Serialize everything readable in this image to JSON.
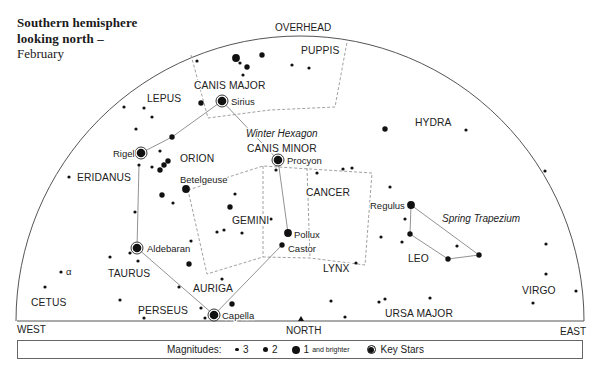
{
  "title": {
    "line1": "Southern hemisphere",
    "line2": "looking north –",
    "line3": "February"
  },
  "legend": {
    "label": "Magnitudes:",
    "mag3": "3",
    "mag2": "2",
    "mag1": "1",
    "mag1_suffix": "and brighter",
    "key": "Key Stars"
  },
  "sky_map": {
    "dome": {
      "cx": 300,
      "cy": 321,
      "rx": 284,
      "ry": 285
    },
    "horizon": {
      "x1": 17,
      "x2": 584,
      "y": 321
    },
    "north_marker": {
      "x": 301,
      "y": 318
    },
    "labels": [
      {
        "text": "OVERHEAD",
        "x": 275,
        "y": 31,
        "kind": "dir"
      },
      {
        "text": "WEST",
        "x": 17,
        "y": 333,
        "kind": "dir"
      },
      {
        "text": "NORTH",
        "x": 286,
        "y": 334,
        "kind": "dir"
      },
      {
        "text": "EAST",
        "x": 560,
        "y": 335,
        "kind": "dir"
      },
      {
        "text": "PUPPIS",
        "x": 301,
        "y": 54,
        "kind": "con"
      },
      {
        "text": "CANIS MAJOR",
        "x": 194,
        "y": 89,
        "kind": "con"
      },
      {
        "text": "Sirius",
        "x": 231,
        "y": 105,
        "kind": "star"
      },
      {
        "text": "LEPUS",
        "x": 147,
        "y": 102,
        "kind": "con"
      },
      {
        "text": "Winter Hexagon",
        "x": 246,
        "y": 137,
        "kind": "ital"
      },
      {
        "text": "CANIS MINOR",
        "x": 247,
        "y": 152,
        "kind": "con"
      },
      {
        "text": "Procyon",
        "x": 287,
        "y": 164,
        "kind": "star"
      },
      {
        "text": "ORION",
        "x": 180,
        "y": 162,
        "kind": "con"
      },
      {
        "text": "Rigel",
        "x": 113,
        "y": 157,
        "kind": "star"
      },
      {
        "text": "ERIDANUS",
        "x": 77,
        "y": 181,
        "kind": "con"
      },
      {
        "text": "Betelgeuse",
        "x": 180,
        "y": 183,
        "kind": "star"
      },
      {
        "text": "HYDRA",
        "x": 415,
        "y": 126,
        "kind": "con"
      },
      {
        "text": "CANCER",
        "x": 306,
        "y": 196,
        "kind": "con"
      },
      {
        "text": "GEMINI",
        "x": 232,
        "y": 224,
        "kind": "con"
      },
      {
        "text": "Pollux",
        "x": 294,
        "y": 238,
        "kind": "star"
      },
      {
        "text": "Castor",
        "x": 288,
        "y": 252,
        "kind": "star"
      },
      {
        "text": "Regulus",
        "x": 370,
        "y": 209,
        "kind": "star"
      },
      {
        "text": "Spring Trapezium",
        "x": 442,
        "y": 222,
        "kind": "ital"
      },
      {
        "text": "LEO",
        "x": 408,
        "y": 262,
        "kind": "con"
      },
      {
        "text": "Aldebaran",
        "x": 147,
        "y": 252,
        "kind": "star"
      },
      {
        "text": "TAURUS",
        "x": 108,
        "y": 277,
        "kind": "con"
      },
      {
        "text": "α",
        "x": 66,
        "y": 275,
        "kind": "star"
      },
      {
        "text": "LYNX",
        "x": 323,
        "y": 272,
        "kind": "con"
      },
      {
        "text": "AURIGA",
        "x": 193,
        "y": 292,
        "kind": "con"
      },
      {
        "text": "CETUS",
        "x": 31,
        "y": 306,
        "kind": "con"
      },
      {
        "text": "PERSEUS",
        "x": 138,
        "y": 314,
        "kind": "con"
      },
      {
        "text": "Capella",
        "x": 222,
        "y": 319,
        "kind": "star"
      },
      {
        "text": "URSA MAJOR",
        "x": 385,
        "y": 317,
        "kind": "con"
      },
      {
        "text": "VIRGO",
        "x": 522,
        "y": 294,
        "kind": "con"
      }
    ],
    "boundaries": [
      {
        "name": "puppis-canis-major-boundary",
        "points": [
          [
            191,
            55
          ],
          [
            208,
            118
          ],
          [
            270,
            110
          ],
          [
            335,
            107
          ],
          [
            347,
            42
          ]
        ],
        "closed": false
      },
      {
        "name": "gemini-cancer-boundary",
        "points": [
          [
            188,
            190
          ],
          [
            263,
            166
          ],
          [
            372,
            173
          ],
          [
            365,
            265
          ],
          [
            310,
            258
          ],
          [
            263,
            257
          ],
          [
            207,
            274
          ]
        ],
        "closed": true
      },
      {
        "name": "gemini-cancer-divider-1",
        "points": [
          [
            263,
            166
          ],
          [
            263,
            257
          ]
        ],
        "closed": false
      },
      {
        "name": "gemini-cancer-divider-2",
        "points": [
          [
            307,
            168
          ],
          [
            310,
            258
          ]
        ],
        "closed": false
      }
    ],
    "asterisms": [
      {
        "name": "winter-hexagon",
        "segments": [
          [
            [
              222,
              101
            ],
            [
              172,
              137
            ],
            [
              141,
              153
            ]
          ],
          [
            [
              222,
              101
            ],
            [
              278,
              160
            ]
          ],
          [
            [
              278,
              160
            ],
            [
              288,
              233
            ]
          ],
          [
            [
              282,
              245
            ],
            [
              214,
              315
            ]
          ],
          [
            [
              214,
              315
            ],
            [
              137,
              248
            ]
          ],
          [
            [
              137,
              248
            ],
            [
              139,
              165
            ]
          ]
        ]
      },
      {
        "name": "spring-trapezium",
        "segments": [
          [
            [
              411,
              205
            ],
            [
              410,
              234
            ],
            [
              448,
              259
            ],
            [
              479,
              255
            ],
            [
              411,
              205
            ]
          ]
        ]
      }
    ],
    "stars": [
      {
        "x": 222,
        "y": 101,
        "mag": "key",
        "name": "Sirius"
      },
      {
        "x": 141,
        "y": 153,
        "mag": "key",
        "name": "Rigel"
      },
      {
        "x": 278,
        "y": 160,
        "mag": "key",
        "name": "Procyon"
      },
      {
        "x": 137,
        "y": 248,
        "mag": "key",
        "name": "Aldebaran"
      },
      {
        "x": 214,
        "y": 315,
        "mag": "key",
        "name": "Capella"
      },
      {
        "x": 186,
        "y": 189,
        "mag": 1,
        "name": "Betelgeuse"
      },
      {
        "x": 288,
        "y": 233,
        "mag": 1,
        "name": "Pollux"
      },
      {
        "x": 411,
        "y": 205,
        "mag": 1,
        "name": "Regulus"
      },
      {
        "x": 236,
        "y": 58,
        "mag": 1
      },
      {
        "x": 282,
        "y": 245,
        "mag": 2,
        "name": "Castor"
      },
      {
        "x": 247,
        "y": 67,
        "mag": 2
      },
      {
        "x": 262,
        "y": 55,
        "mag": 2
      },
      {
        "x": 201,
        "y": 103,
        "mag": 2
      },
      {
        "x": 172,
        "y": 137,
        "mag": 2
      },
      {
        "x": 160,
        "y": 170,
        "mag": 2
      },
      {
        "x": 164,
        "y": 165,
        "mag": 2
      },
      {
        "x": 168,
        "y": 161,
        "mag": 2
      },
      {
        "x": 162,
        "y": 195,
        "mag": 2
      },
      {
        "x": 230,
        "y": 207,
        "mag": 2
      },
      {
        "x": 189,
        "y": 264,
        "mag": 2
      },
      {
        "x": 232,
        "y": 304,
        "mag": 2
      },
      {
        "x": 385,
        "y": 129,
        "mag": 2
      },
      {
        "x": 410,
        "y": 234,
        "mag": 2
      },
      {
        "x": 448,
        "y": 259,
        "mag": 2
      },
      {
        "x": 479,
        "y": 255,
        "mag": 2
      },
      {
        "x": 197,
        "y": 61,
        "mag": 3
      },
      {
        "x": 240,
        "y": 63,
        "mag": 3
      },
      {
        "x": 243,
        "y": 75,
        "mag": 3
      },
      {
        "x": 292,
        "y": 65,
        "mag": 3
      },
      {
        "x": 309,
        "y": 68,
        "mag": 3
      },
      {
        "x": 124,
        "y": 107,
        "mag": 3
      },
      {
        "x": 144,
        "y": 108,
        "mag": 3
      },
      {
        "x": 152,
        "y": 117,
        "mag": 3
      },
      {
        "x": 136,
        "y": 129,
        "mag": 3
      },
      {
        "x": 160,
        "y": 151,
        "mag": 3
      },
      {
        "x": 139,
        "y": 165,
        "mag": 3
      },
      {
        "x": 152,
        "y": 167,
        "mag": 3
      },
      {
        "x": 173,
        "y": 203,
        "mag": 3
      },
      {
        "x": 135,
        "y": 212,
        "mag": 3
      },
      {
        "x": 69,
        "y": 177,
        "mag": 3
      },
      {
        "x": 235,
        "y": 194,
        "mag": 3
      },
      {
        "x": 217,
        "y": 232,
        "mag": 3
      },
      {
        "x": 224,
        "y": 230,
        "mag": 3
      },
      {
        "x": 242,
        "y": 233,
        "mag": 3
      },
      {
        "x": 271,
        "y": 219,
        "mag": 3
      },
      {
        "x": 276,
        "y": 170,
        "mag": 3
      },
      {
        "x": 317,
        "y": 173,
        "mag": 3
      },
      {
        "x": 343,
        "y": 169,
        "mag": 3
      },
      {
        "x": 352,
        "y": 168,
        "mag": 3
      },
      {
        "x": 356,
        "y": 263,
        "mag": 3
      },
      {
        "x": 191,
        "y": 241,
        "mag": 3
      },
      {
        "x": 110,
        "y": 257,
        "mag": 3
      },
      {
        "x": 130,
        "y": 253,
        "mag": 3
      },
      {
        "x": 138,
        "y": 261,
        "mag": 3
      },
      {
        "x": 61,
        "y": 272,
        "mag": 3
      },
      {
        "x": 45,
        "y": 287,
        "mag": 3
      },
      {
        "x": 120,
        "y": 300,
        "mag": 3
      },
      {
        "x": 179,
        "y": 287,
        "mag": 3
      },
      {
        "x": 144,
        "y": 318,
        "mag": 3
      },
      {
        "x": 201,
        "y": 308,
        "mag": 3
      },
      {
        "x": 205,
        "y": 318,
        "mag": 3
      },
      {
        "x": 222,
        "y": 279,
        "mag": 3
      },
      {
        "x": 331,
        "y": 301,
        "mag": 3
      },
      {
        "x": 345,
        "y": 317,
        "mag": 3
      },
      {
        "x": 379,
        "y": 302,
        "mag": 3
      },
      {
        "x": 385,
        "y": 299,
        "mag": 3
      },
      {
        "x": 430,
        "y": 298,
        "mag": 3
      },
      {
        "x": 533,
        "y": 303,
        "mag": 3
      },
      {
        "x": 546,
        "y": 274,
        "mag": 3
      },
      {
        "x": 576,
        "y": 291,
        "mag": 3
      },
      {
        "x": 546,
        "y": 244,
        "mag": 3
      },
      {
        "x": 545,
        "y": 171,
        "mag": 3
      },
      {
        "x": 466,
        "y": 130,
        "mag": 3
      },
      {
        "x": 390,
        "y": 187,
        "mag": 3
      },
      {
        "x": 381,
        "y": 237,
        "mag": 3
      },
      {
        "x": 405,
        "y": 219,
        "mag": 3
      },
      {
        "x": 402,
        "y": 242,
        "mag": 3
      },
      {
        "x": 457,
        "y": 246,
        "mag": 3
      }
    ]
  }
}
